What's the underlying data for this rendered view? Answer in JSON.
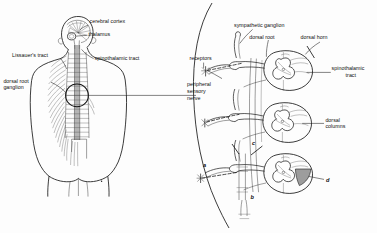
{
  "figure": {
    "background_color": "#fdfdfd",
    "ink_color": "#1a1a1a",
    "shade_color": "#9d9d9d",
    "cord_color": "#a8a8a8"
  },
  "left_panel": {
    "name": "whole-body-overview",
    "description": "Posterior view of human torso and head showing brain, spinal cord and segmental spinal nerves",
    "labels": {
      "cerebral_cortex": "cerebral cortex",
      "thalamus": "thalamus",
      "spinothalamic_tract": "spinothalamic tract",
      "lissauers_tract": "Lissauer's tract",
      "dorsal_root_ganglion_line1": "dorsal root",
      "dorsal_root_ganglion_line2": "ganglion"
    },
    "callout": {
      "name": "magnified-segment-circle",
      "shape": "circle"
    }
  },
  "right_panel": {
    "name": "magnified-spinal-segments",
    "description": "Magnified view of three stacked spinal cord cross sections with afferent fibers, dorsal roots and sympathetic ganglia",
    "labels": {
      "sympathetic_ganglion": "sympathetic ganglion",
      "dorsal_root": "dorsal root",
      "dorsal_horn": "dorsal horn",
      "spinothalamic_line1": "spinothalamic",
      "spinothalamic_line2": "tract",
      "dorsal_columns_line1": "dorsal",
      "dorsal_columns_line2": "columns",
      "receptors": "receptors",
      "peripheral_nerve_line1": "peripheral",
      "peripheral_nerve_line2": "sensory",
      "peripheral_nerve_line3": "nerve"
    },
    "markers": [
      {
        "id": "a",
        "text": "a"
      },
      {
        "id": "b",
        "text": "b"
      },
      {
        "id": "c",
        "text": "c"
      },
      {
        "id": "d",
        "text": "d"
      }
    ]
  }
}
